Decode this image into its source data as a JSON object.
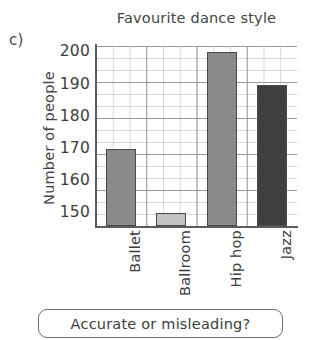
{
  "question_letter": "c)",
  "prompt": {
    "text": "Accurate or misleading?"
  },
  "chart_data": {
    "type": "bar",
    "title": "Favourite dance style",
    "xlabel": "",
    "ylabel": "Number of people",
    "categories": [
      "Ballet",
      "Ballroom",
      "Hip hop",
      "Jazz"
    ],
    "values": [
      170,
      150,
      200,
      190
    ],
    "ylim": [
      146,
      202
    ],
    "yticks": [
      150,
      160,
      170,
      180,
      190,
      200
    ],
    "ytick_labels": [
      "150",
      "160",
      "170",
      "180",
      "190",
      "200"
    ],
    "grid": true,
    "legend": false,
    "bar_colors": [
      "#8a8a8a",
      "#c2c2c2",
      "#8a8a8a",
      "#3f3f3f"
    ],
    "bar_border_color": "#4a4a4a",
    "axis_color": "#5c5c5c",
    "note": "truncated y-axis starting near 146 rather than 0"
  }
}
